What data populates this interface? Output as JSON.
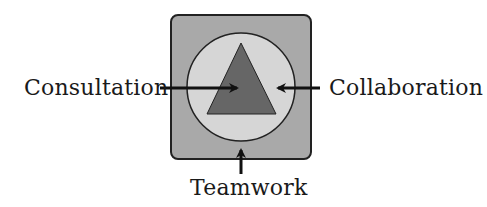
{
  "diagram": {
    "labels": {
      "left": "Consultation",
      "right": "Collaboration",
      "bottom": "Teamwork"
    },
    "shapes": {
      "outer_square": {
        "name": "rounded-square",
        "fill": "#a9a9a9",
        "stroke": "#222222"
      },
      "circle": {
        "name": "circle",
        "fill": "#d6d6d6",
        "stroke": "#222222"
      },
      "triangle": {
        "name": "triangle",
        "fill": "#666666",
        "stroke": "#222222"
      }
    },
    "arrows": [
      {
        "from": "Consultation",
        "direction": "right",
        "target": "triangle"
      },
      {
        "from": "Collaboration",
        "direction": "left",
        "target": "circle"
      },
      {
        "from": "Teamwork",
        "direction": "up",
        "target": "outer_square"
      }
    ],
    "colors": {
      "arrow": "#111111",
      "text": "#1a1a1a"
    }
  }
}
